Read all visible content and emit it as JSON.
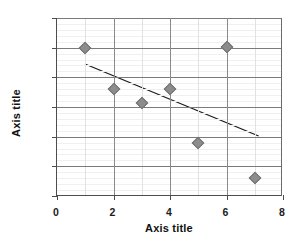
{
  "chart_data": {
    "type": "scatter",
    "title": "",
    "xlabel": "Axis title",
    "ylabel": "Axis title",
    "xlim": [
      0,
      8
    ],
    "ylim": [
      0,
      0.3
    ],
    "x_ticks": [
      "0",
      "2",
      "4",
      "6",
      "8"
    ],
    "x_tick_values": [
      0,
      2,
      4,
      6,
      8
    ],
    "y_ticks": [
      "0%",
      "5%",
      "10%",
      "15%",
      "20%",
      "25%",
      "30%"
    ],
    "y_tick_values": [
      0,
      0.05,
      0.1,
      0.15,
      0.2,
      0.25,
      0.3
    ],
    "x_minor_gridlines": [
      1,
      3,
      5,
      7
    ],
    "grid": true,
    "legend": "none",
    "series": [
      {
        "name": "Series 1",
        "marker": "diamond",
        "color": "#8c8c8c",
        "points": [
          {
            "x": 1,
            "y": 0.25,
            "label": "25%"
          },
          {
            "x": 2,
            "y": 0.18,
            "label": "18%"
          },
          {
            "x": 3,
            "y": 0.157,
            "label": "15.7%"
          },
          {
            "x": 4,
            "y": 0.18,
            "label": "18%"
          },
          {
            "x": 5,
            "y": 0.09,
            "label": "9%"
          },
          {
            "x": 6,
            "y": 0.251,
            "label": "25.1%"
          },
          {
            "x": 7,
            "y": 0.031,
            "label": "3.1%"
          }
        ]
      }
    ],
    "trendline": {
      "name": "Linear trendline",
      "color": "#1a1a1a",
      "x_start": 1.0,
      "y_start": 0.222,
      "x_end": 7.2,
      "y_end": 0.1
    }
  }
}
